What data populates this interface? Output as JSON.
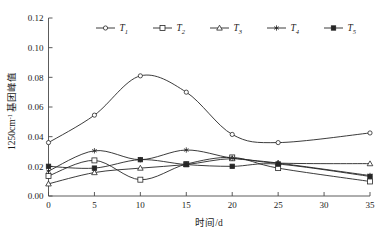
{
  "chart_data": {
    "type": "line",
    "title": "",
    "xlabel": "时间/d",
    "ylabel": "1250cm⁻¹ 基团峰值",
    "x": [
      0,
      5,
      10,
      15,
      20,
      25,
      35
    ],
    "xlim": [
      0,
      35
    ],
    "ylim": [
      0,
      0.12
    ],
    "xticks": [
      "0",
      "5",
      "10",
      "15",
      "20",
      "25",
      "30",
      "35"
    ],
    "xtick_values": [
      0,
      5,
      10,
      15,
      20,
      25,
      30,
      35
    ],
    "yticks": [
      "0.00",
      "0.02",
      "0.04",
      "0.06",
      "0.08",
      "0.10",
      "0.12"
    ],
    "ytick_values": [
      0.0,
      0.02,
      0.04,
      0.06,
      0.08,
      0.1,
      0.12
    ],
    "grid": false,
    "legend_position": "top-center",
    "series": [
      {
        "name": "T1",
        "label": "T",
        "subscript": "1",
        "marker": "circle-open",
        "values": [
          0.036,
          0.0545,
          0.081,
          0.07,
          0.0415,
          0.036,
          0.0425
        ]
      },
      {
        "name": "T2",
        "label": "T",
        "subscript": "2",
        "marker": "square-open",
        "values": [
          0.0135,
          0.024,
          0.011,
          0.0215,
          0.026,
          0.0188,
          0.0098
        ]
      },
      {
        "name": "T3",
        "label": "T",
        "subscript": "3",
        "marker": "triangle-open",
        "values": [
          0.0082,
          0.0158,
          0.0188,
          0.0212,
          0.0252,
          0.0222,
          0.0218
        ]
      },
      {
        "name": "T4",
        "label": "T",
        "subscript": "4",
        "marker": "star",
        "values": [
          0.0168,
          0.0305,
          0.0245,
          0.031,
          0.0255,
          0.0222,
          0.0138
        ]
      },
      {
        "name": "T5",
        "label": "T",
        "subscript": "5",
        "marker": "square-filled",
        "values": [
          0.02,
          0.0188,
          0.0245,
          0.0212,
          0.02,
          0.0215,
          0.0132
        ]
      }
    ]
  },
  "axes": {
    "y_label_text": "1250cm",
    "y_label_sup": "-1",
    "y_label_tail": " 基团峰值",
    "x_label_text": "时间/d"
  },
  "colors": {
    "line": "#262626",
    "axis": "#4a4a4a",
    "background": "#ffffff",
    "text": "#1a1a1a"
  }
}
